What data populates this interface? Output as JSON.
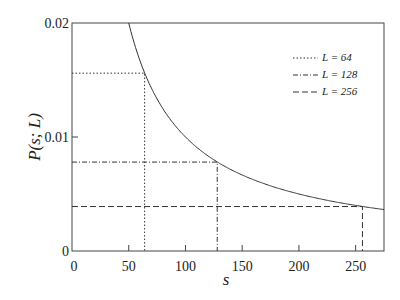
{
  "chart_data": {
    "type": "line",
    "title": "",
    "xlabel": "s",
    "ylabel": "P(s; L)",
    "xlim": [
      0,
      275
    ],
    "ylim": [
      0,
      0.02
    ],
    "x_ticks": [
      "0",
      "50",
      "100",
      "150",
      "200",
      "250"
    ],
    "y_ticks": [
      "0",
      "0.01",
      "0.02"
    ],
    "grid": false,
    "legend_position": "upper right",
    "curve": {
      "name": "P(s) = 1/s",
      "function": "1/s",
      "x_range": [
        50,
        275
      ]
    },
    "series": [
      {
        "name": "L =  64",
        "style": "dotted",
        "s": 64,
        "P": 0.0156
      },
      {
        "name": "L = 128",
        "style": "dash-dot",
        "s": 128,
        "P": 0.0078
      },
      {
        "name": "L = 256",
        "style": "dashed",
        "s": 256,
        "P": 0.0039
      }
    ]
  },
  "legend": [
    "L =  64",
    "L = 128",
    "L = 256"
  ]
}
